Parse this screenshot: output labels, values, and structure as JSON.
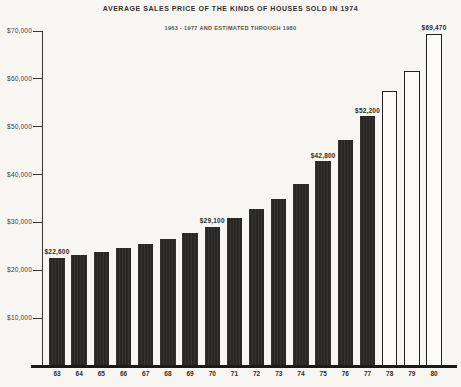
{
  "chart_data": {
    "type": "bar",
    "title": "AVERAGE SALES PRICE OF THE KINDS OF HOUSES SOLD IN 1974",
    "subtitle": "1963 - 1977 AND ESTIMATED THROUGH 1980",
    "xlabel": "",
    "ylabel": "",
    "categories": [
      "63",
      "64",
      "65",
      "66",
      "67",
      "68",
      "69",
      "70",
      "71",
      "72",
      "73",
      "74",
      "75",
      "76",
      "77",
      "78",
      "79",
      "80"
    ],
    "values": [
      22600,
      23200,
      23900,
      24700,
      25500,
      26600,
      27700,
      29100,
      31000,
      32900,
      35000,
      38100,
      42800,
      47300,
      52200,
      57400,
      61700,
      69470
    ],
    "bar_styles": [
      "filled",
      "filled",
      "filled",
      "filled",
      "filled",
      "filled",
      "filled",
      "filled",
      "filled",
      "filled",
      "filled",
      "filled",
      "filled",
      "filled",
      "filled",
      "outlined",
      "outlined",
      "outlined"
    ],
    "outlined_bars_meaning": "estimated values (1978-1980)",
    "value_labels": [
      {
        "index": 0,
        "text": "$22,600"
      },
      {
        "index": 7,
        "text": "$29,100"
      },
      {
        "index": 12,
        "text": "$42,800"
      },
      {
        "index": 14,
        "text": "$52,200"
      },
      {
        "index": 17,
        "text": "$69,470"
      }
    ],
    "ylim": [
      0,
      70000
    ],
    "ytick_interval": 10000,
    "yticks": [
      {
        "value": 70000,
        "label": "$70,000"
      },
      {
        "value": 60000,
        "label": "$60,000"
      },
      {
        "value": 50000,
        "label": "$50,000"
      },
      {
        "value": 40000,
        "label": "$40,000"
      },
      {
        "value": 30000,
        "label": "$30,000"
      },
      {
        "value": 20000,
        "label": "$20,000"
      },
      {
        "value": 10000,
        "label": "$10,000"
      }
    ],
    "grid": false,
    "legend": "none",
    "colors": {
      "bar_fill": "#2a2927",
      "bar_outline": "#23221f",
      "axis": "#3a3936",
      "background": "#f7f6f3",
      "text": "#2e2d2a"
    }
  }
}
